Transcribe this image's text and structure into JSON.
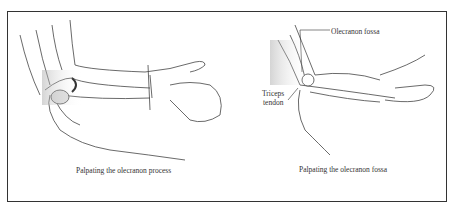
{
  "figure": {
    "panels": [
      {
        "id": "left",
        "illustration": "hand palpating olecranon process of flexed elbow, forearm supported by other hand",
        "caption": "Palpating the olecranon process"
      },
      {
        "id": "right",
        "illustration": "hand palpating olecranon fossa with triceps tendon indicated",
        "caption": "Palpating the olecranon fossa",
        "labels": {
          "olecranon_fossa": "Olecranon fossa",
          "triceps_line1": "Triceps",
          "triceps_line2": "tendon"
        }
      }
    ],
    "colors": {
      "border": "#333333",
      "line": "#444444",
      "shade": "#bbbbbb",
      "background": "#ffffff"
    }
  }
}
